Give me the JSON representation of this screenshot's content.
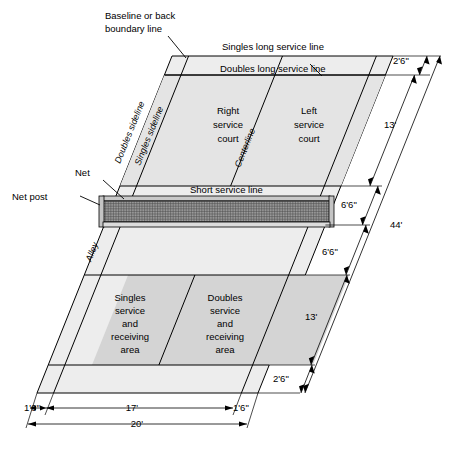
{
  "diagram": {
    "colors": {
      "court_outer_fill": "#ededed",
      "court_service_fill": "#e4e4e4",
      "receiving_area_fill": "#d4d4d4",
      "line": "#000000",
      "net_mesh": "#555555",
      "net_band": "#c9c9c9"
    },
    "labels": {
      "baseline": "Baseline or back\nboundary line",
      "baseline_line1": "Baseline or back",
      "baseline_line2": "boundary line",
      "singles_long_service_line": "Singles long service line",
      "doubles_long_service_line": "Doubles long service line",
      "short_service_line": "Short service line",
      "doubles_sideline": "Doubles sideline",
      "singles_sideline": "Singles sideline",
      "centerline": "Centerline",
      "alley": "Alley",
      "net": "Net",
      "net_post": "Net post",
      "right_service_court": "Right\nservice\ncourt",
      "right_service_court_lines": [
        "Right",
        "service",
        "court"
      ],
      "left_service_court_lines": [
        "Left",
        "service",
        "court"
      ],
      "singles_receiving_lines": [
        "Singles",
        "service",
        "and",
        "receiving",
        "area"
      ],
      "doubles_receiving_lines": [
        "Doubles",
        "service",
        "and",
        "receiving",
        "area"
      ]
    },
    "dimensions": {
      "top_back_alley": "2'6\"",
      "top_half_court": "13'",
      "upper_half_short": "6'6\"",
      "lower_half_short": "6'6\"",
      "bottom_half_court": "13'",
      "bottom_back_alley": "2'6\"",
      "full_length": "44'",
      "left_alley_width": "1'6\"",
      "singles_width": "17'",
      "right_alley_width": "1'6\"",
      "doubles_width": "20'"
    }
  }
}
